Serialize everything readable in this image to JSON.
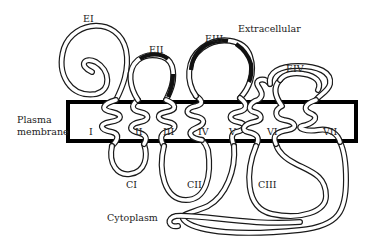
{
  "diagram": {
    "regions": {
      "extracellular": "Extracellular",
      "membrane_line1": "Plasma",
      "membrane_line2": "membrane",
      "cytoplasm": "Cytoplasm"
    },
    "extracellular_loops": [
      "EI",
      "EII",
      "EIII",
      "EIV"
    ],
    "transmembrane_segments": [
      "I",
      "II",
      "III",
      "IV",
      "V",
      "VI",
      "VII"
    ],
    "cytoplasmic_loops": [
      "CI",
      "CII",
      "CIII"
    ],
    "colors": {
      "membrane_border": "#000000",
      "chain_outline": "#1a1a1a",
      "chain_fill": "#ffffff",
      "highlight_segment": "#111111",
      "text": "#222222"
    }
  }
}
